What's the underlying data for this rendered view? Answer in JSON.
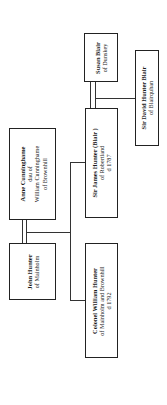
{
  "people": {
    "john": {
      "name": "John Hunter",
      "lines": [
        "of Mainholm"
      ]
    },
    "anne": {
      "name": "Anne Cunninghame",
      "lines": [
        "dau of",
        "William Cunninghame",
        "of Brownhill"
      ]
    },
    "william": {
      "name": "Colonel William Hunter",
      "lines": [
        "of Mainholm and Brownhill",
        "d 1792"
      ]
    },
    "james": {
      "name": "Sir James Hunter (Blair )",
      "lines": [
        "of Robertland",
        "d 1787"
      ]
    },
    "susan": {
      "name": "Susan Blair",
      "lines": [
        "of Dunskey"
      ]
    },
    "david": {
      "name": "Sir David Hunter Blair",
      "lines": [
        "of Blairquhan"
      ]
    }
  },
  "relationships": [
    {
      "type": "marriage",
      "from": "john",
      "to": "anne"
    },
    {
      "type": "child",
      "parents": [
        "john",
        "anne"
      ],
      "child": "william"
    },
    {
      "type": "child",
      "parents": [
        "john",
        "anne"
      ],
      "child": "james"
    },
    {
      "type": "marriage",
      "from": "james",
      "to": "susan"
    },
    {
      "type": "child",
      "parents": [
        "james",
        "susan"
      ],
      "child": "david"
    }
  ]
}
